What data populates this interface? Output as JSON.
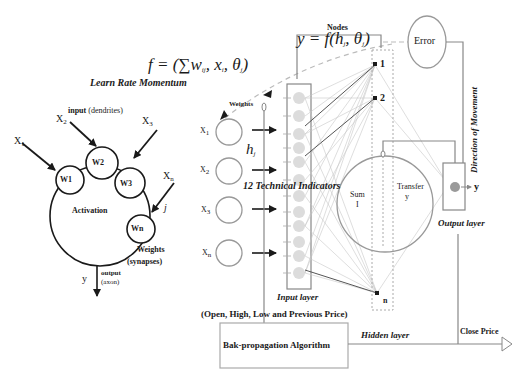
{
  "formulas": {
    "output": "y = f(h",
    "output_sub": "j",
    "output_rest": ", θ",
    "output_sub2": "j",
    "output_end": ")",
    "sum": "f = (∑w",
    "sum_sub": "ij",
    "sum_rest": ", x",
    "sum_sub2": "i",
    "sum_rest2": ", θ",
    "sum_sub3": "j",
    "sum_end": ")"
  },
  "neuron": {
    "title": "Learn Rate Momentum",
    "input_label": "input",
    "input_paren": "(dendrites)",
    "inputs": [
      "X",
      "X",
      "X",
      "X"
    ],
    "input_subs": [
      "1",
      "2",
      "3",
      "n"
    ],
    "weights": [
      "W1",
      "W2",
      "W3",
      "Wn"
    ],
    "body_label": "Activation",
    "j_label": "j",
    "weights_label": "Weights",
    "synapses_label": "(synapses)",
    "output_var": "y",
    "output_label": "output",
    "axon_label": "(axon)"
  },
  "network": {
    "nodes_label": "Nodes",
    "weights_label": "Weights",
    "hj_label": "h",
    "hj_sub": "j",
    "inputs": [
      "X",
      "X",
      "X",
      "X"
    ],
    "input_subs": [
      "1",
      "2",
      "3",
      "n"
    ],
    "indicators_label": "12 Technical Indicators",
    "input_layer_label": "Input layer",
    "input_desc": "(Open, High, Low and Previous Price)",
    "hidden_nodes": [
      "1",
      "2",
      "n"
    ],
    "sum_label": "Sum",
    "sum_var": "I",
    "transfer_label": "Transfer",
    "transfer_var": "y",
    "hidden_layer_label": "Hidden layer",
    "error_label": "Error",
    "direction_label": "Direction of Movement",
    "output_var": "y",
    "output_layer_label": "Output layer",
    "close_price_label": "Close Price",
    "backprop_label": "Bak-propagation Algorithm"
  },
  "colors": {
    "line": "#777777",
    "dark": "#1a1a1a",
    "node_fill": "#d9d9d9",
    "output_node": "#9a9a9a"
  }
}
